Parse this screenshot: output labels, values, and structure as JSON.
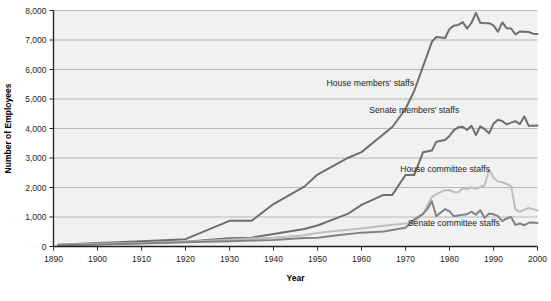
{
  "chart_data": {
    "type": "line",
    "title": "",
    "xlabel": "Year",
    "ylabel": "Number of Employees",
    "xlim": [
      1890,
      2000
    ],
    "ylim": [
      0,
      8000
    ],
    "grid": true,
    "legend_position": "inline-annotations",
    "xticks": [
      "1890",
      "1900",
      "1910",
      "1920",
      "1930",
      "1940",
      "1950",
      "1960",
      "1970",
      "1980",
      "1990",
      "2000"
    ],
    "yticks": [
      "0",
      "1,000",
      "2,000",
      "3,000",
      "4,000",
      "5,000",
      "6,000",
      "7,000",
      "8,000"
    ],
    "colors": {
      "house_members": "#6d6e71",
      "senate_members": "#6d6e71",
      "house_committee": "#bcbec0",
      "senate_committee": "#808285",
      "plot_background": "#f1f1f1",
      "gridline": "#a7a9ac",
      "axis": "#231f20"
    },
    "series": [
      {
        "name": "House members' staffs",
        "color": "#6d6e71",
        "label_x": 1962,
        "label_y": 5450,
        "x": [
          1891,
          1900,
          1910,
          1920,
          1930,
          1935,
          1940,
          1947,
          1950,
          1957,
          1960,
          1967,
          1970,
          1972,
          1974,
          1976,
          1977,
          1979,
          1980,
          1981,
          1982,
          1983,
          1984,
          1985,
          1986,
          1987,
          1988,
          1989,
          1990,
          1991,
          1992,
          1993,
          1994,
          1995,
          1996,
          1997,
          1998,
          1999,
          2000
        ],
        "y": [
          62,
          120,
          180,
          250,
          870,
          870,
          1440,
          2030,
          2440,
          3010,
          3200,
          4050,
          4660,
          5280,
          6110,
          6939,
          7100,
          7067,
          7371,
          7487,
          7511,
          7606,
          7385,
          7584,
          7920,
          7584,
          7564,
          7569,
          7496,
          7278,
          7597,
          7400,
          7390,
          7186,
          7288,
          7282,
          7269,
          7216,
          7204
        ]
      },
      {
        "name": "Senate members' staffs",
        "color": "#6d6e71",
        "label_x": 1972,
        "label_y": 4520,
        "x": [
          1891,
          1900,
          1910,
          1920,
          1930,
          1935,
          1940,
          1947,
          1950,
          1957,
          1960,
          1965,
          1967,
          1970,
          1972,
          1974,
          1976,
          1977,
          1979,
          1980,
          1981,
          1982,
          1983,
          1984,
          1985,
          1986,
          1987,
          1988,
          1989,
          1990,
          1991,
          1992,
          1993,
          1994,
          1995,
          1996,
          1997,
          1998,
          1999,
          2000
        ],
        "y": [
          39,
          80,
          120,
          160,
          280,
          300,
          420,
          590,
          711,
          1115,
          1410,
          1749,
          1749,
          2426,
          2426,
          3197,
          3251,
          3554,
          3612,
          3746,
          3945,
          4041,
          4059,
          3949,
          4097,
          3774,
          4075,
          3977,
          3837,
          4162,
          4294,
          4249,
          4138,
          4200,
          4247,
          4151,
          4410,
          4090,
          4092,
          4100
        ]
      },
      {
        "name": "House committee staffs",
        "color": "#bcbec0",
        "label_x": 1979,
        "label_y": 2520,
        "x": [
          1891,
          1900,
          1910,
          1920,
          1930,
          1935,
          1940,
          1947,
          1950,
          1955,
          1960,
          1965,
          1970,
          1972,
          1974,
          1976,
          1977,
          1979,
          1980,
          1981,
          1982,
          1983,
          1984,
          1985,
          1986,
          1987,
          1988,
          1989,
          1990,
          1991,
          1992,
          1993,
          1994,
          1995,
          1996,
          1997,
          1998,
          1999,
          2000
        ],
        "y": [
          62,
          90,
          120,
          160,
          230,
          270,
          300,
          380,
          460,
          540,
          610,
          700,
          780,
          817,
          1107,
          1680,
          1776,
          1909,
          1917,
          1843,
          1839,
          1970,
          1944,
          2009,
          1954,
          2024,
          2075,
          2611,
          2321,
          2201,
          2178,
          2118,
          2046,
          1246,
          1177,
          1250,
          1305,
          1267,
          1225
        ]
      },
      {
        "name": "Senate committee staffs",
        "color": "#808285",
        "label_x": 1981,
        "label_y": 690,
        "x": [
          1891,
          1900,
          1910,
          1920,
          1930,
          1935,
          1940,
          1947,
          1950,
          1955,
          1960,
          1965,
          1970,
          1972,
          1974,
          1975,
          1976,
          1977,
          1979,
          1980,
          1981,
          1982,
          1983,
          1984,
          1985,
          1986,
          1987,
          1988,
          1989,
          1990,
          1991,
          1992,
          1993,
          1994,
          1995,
          1996,
          1997,
          1998,
          1999,
          2000
        ],
        "y": [
          41,
          70,
          100,
          140,
          180,
          200,
          220,
          290,
          300,
          386,
          470,
          509,
          635,
          918,
          1107,
          1277,
          1534,
          1028,
          1269,
          1191,
          1022,
          1047,
          1075,
          1095,
          1178,
          1075,
          1231,
          970,
          1116,
          1090,
          1030,
          860,
          950,
          1000,
          732,
          780,
          720,
          805,
          810,
          800
        ]
      }
    ]
  }
}
